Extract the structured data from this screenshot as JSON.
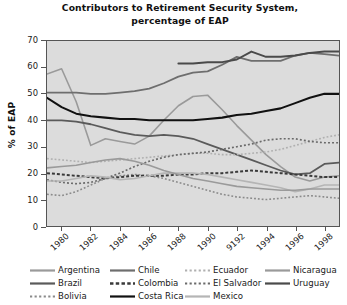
{
  "chart_data": {
    "type": "line",
    "title": "Contributors to Retirement Security System, percentage of EAP",
    "title_line1": "Contributors to Retirement Security System,",
    "title_line2": "percentage of EAP",
    "xlabel": "",
    "ylabel": "% of EAP",
    "ylim": [
      0,
      70
    ],
    "yticks": [
      0,
      10,
      20,
      30,
      40,
      50,
      60,
      70
    ],
    "ytick_labels": [
      "0",
      "10",
      "20",
      "30",
      "40",
      "50",
      "60",
      "70"
    ],
    "xlim": [
      1979,
      1999
    ],
    "xticks": [
      1980,
      1982,
      1984,
      1986,
      1988,
      1990,
      1992,
      1994,
      1996,
      1998
    ],
    "xtick_labels": [
      "1980",
      "1982",
      "1984",
      "1986",
      "1988",
      "1990",
      "9192",
      "1994",
      "1996",
      "1998"
    ],
    "x": [
      1979,
      1980,
      1981,
      1982,
      1983,
      1984,
      1985,
      1986,
      1987,
      1988,
      1989,
      1990,
      1991,
      1992,
      1993,
      1994,
      1995,
      1996,
      1997,
      1998,
      1999
    ],
    "grid": false,
    "plot_background": "#dcdcdc",
    "legend_position": "below",
    "legend_columns": 4,
    "series": [
      {
        "name": "Argentina",
        "color": "#9a9a9a",
        "style": "solid",
        "width": 1.6,
        "values": [
          57.5,
          59.5,
          47.0,
          30.5,
          33.0,
          32.0,
          31.0,
          34.0,
          40.0,
          45.5,
          49.0,
          49.5,
          44.0,
          38.0,
          32.5,
          27.0,
          22.5,
          18.5,
          17.0,
          18.5,
          19.0
        ]
      },
      {
        "name": "Brazil",
        "color": "#5a5a5a",
        "style": "solid",
        "width": 1.8,
        "values": [
          40.0,
          40.0,
          39.5,
          38.5,
          37.0,
          35.5,
          34.5,
          34.0,
          34.5,
          34.0,
          33.0,
          31.0,
          29.0,
          27.0,
          25.0,
          23.0,
          21.0,
          19.5,
          20.0,
          23.5,
          24.0
        ]
      },
      {
        "name": "Bolivia",
        "color": "#8a8a8a",
        "style": "dotted",
        "width": 1.6,
        "values": [
          12.0,
          11.5,
          13.0,
          15.5,
          18.0,
          19.0,
          19.5,
          19.0,
          18.0,
          16.5,
          15.0,
          13.5,
          12.0,
          11.0,
          10.5,
          10.0,
          10.5,
          11.0,
          11.5,
          11.0,
          10.5
        ]
      },
      {
        "name": "Chile",
        "color": "#6e6e6e",
        "style": "solid",
        "width": 1.8,
        "values": [
          50.5,
          50.5,
          50.5,
          50.0,
          50.0,
          50.5,
          51.0,
          52.0,
          54.0,
          56.5,
          58.0,
          58.5,
          61.0,
          64.0,
          62.5,
          62.5,
          62.5,
          64.5,
          65.5,
          65.0,
          64.5
        ]
      },
      {
        "name": "Colombia",
        "color": "#3a3a3a",
        "style": "dashed",
        "width": 2.0,
        "values": [
          20.0,
          19.5,
          19.0,
          18.5,
          18.0,
          18.5,
          19.0,
          19.0,
          19.0,
          19.5,
          19.5,
          20.0,
          20.0,
          20.5,
          21.0,
          20.5,
          20.0,
          19.5,
          19.0,
          18.5,
          18.5
        ]
      },
      {
        "name": "Costa Rica",
        "color": "#111111",
        "style": "solid",
        "width": 2.1,
        "values": [
          48.5,
          45.0,
          42.5,
          41.5,
          41.0,
          40.5,
          40.5,
          40.0,
          40.0,
          40.0,
          40.0,
          40.5,
          41.0,
          42.0,
          42.5,
          43.5,
          44.5,
          46.5,
          48.5,
          50.0,
          50.0
        ]
      },
      {
        "name": "Ecuador",
        "color": "#b0b0b0",
        "style": "dotted",
        "width": 1.6,
        "values": [
          25.5,
          25.0,
          24.5,
          24.0,
          24.5,
          25.0,
          25.5,
          26.0,
          26.5,
          27.0,
          27.5,
          27.5,
          27.0,
          27.0,
          27.5,
          28.0,
          29.0,
          30.5,
          32.0,
          33.5,
          34.5
        ]
      },
      {
        "name": "El Salvador",
        "color": "#6a6a6a",
        "style": "dotted",
        "width": 1.7,
        "values": [
          17.5,
          16.5,
          16.0,
          16.5,
          18.0,
          20.0,
          22.5,
          24.5,
          26.0,
          27.0,
          27.5,
          28.0,
          29.0,
          30.0,
          31.0,
          32.5,
          33.0,
          33.0,
          32.0,
          31.5,
          31.5
        ]
      },
      {
        "name": "Mexico",
        "color": "#b5b5b5",
        "style": "solid",
        "width": 1.6,
        "values": [
          17.0,
          17.0,
          18.0,
          19.0,
          18.5,
          17.5,
          18.0,
          19.0,
          20.0,
          20.0,
          20.0,
          19.5,
          18.5,
          17.5,
          16.5,
          15.5,
          14.5,
          13.0,
          14.0,
          15.5,
          15.5
        ]
      },
      {
        "name": "Nicaragua",
        "color": "#9a9a9a",
        "style": "solid",
        "width": 1.6,
        "values": [
          22.0,
          22.5,
          23.0,
          24.0,
          25.0,
          25.5,
          24.5,
          23.0,
          21.0,
          19.5,
          18.0,
          17.0,
          16.0,
          15.0,
          14.5,
          14.0,
          13.5,
          13.5,
          14.0,
          14.0,
          14.0
        ]
      },
      {
        "name": "Uruguay",
        "color": "#4a4a4a",
        "style": "solid",
        "width": 2.0,
        "values": [
          null,
          null,
          null,
          null,
          null,
          null,
          null,
          null,
          null,
          61.5,
          61.5,
          62.0,
          62.0,
          63.0,
          66.0,
          64.0,
          64.0,
          64.5,
          65.5,
          66.0,
          66.0
        ]
      }
    ],
    "legend": [
      {
        "name": "Argentina",
        "color": "#9a9a9a",
        "style": "solid"
      },
      {
        "name": "Chile",
        "color": "#6e6e6e",
        "style": "solid"
      },
      {
        "name": "Ecuador",
        "color": "#b0b0b0",
        "style": "dotted"
      },
      {
        "name": "Nicaragua",
        "color": "#9a9a9a",
        "style": "solid"
      },
      {
        "name": "Brazil",
        "color": "#5a5a5a",
        "style": "solid"
      },
      {
        "name": "Colombia",
        "color": "#3a3a3a",
        "style": "dashed"
      },
      {
        "name": "El Salvador",
        "color": "#6a6a6a",
        "style": "dotted"
      },
      {
        "name": "Uruguay",
        "color": "#4a4a4a",
        "style": "solid"
      },
      {
        "name": "Bolivia",
        "color": "#8a8a8a",
        "style": "dotted"
      },
      {
        "name": "Costa Rica",
        "color": "#111111",
        "style": "solid"
      },
      {
        "name": "Mexico",
        "color": "#b5b5b5",
        "style": "solid"
      }
    ]
  }
}
